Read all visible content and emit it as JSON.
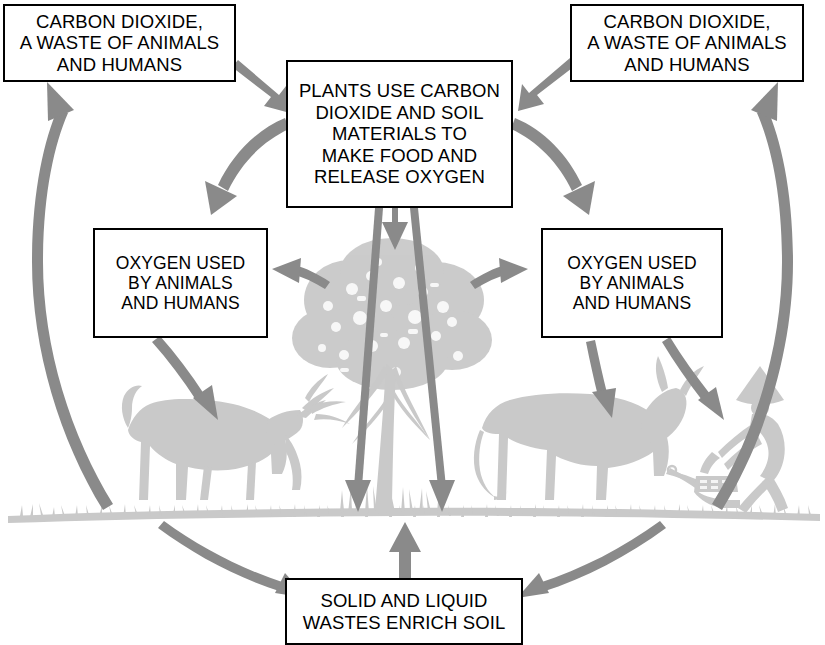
{
  "diagram": {
    "colors": {
      "arrow": "#8a8a8a",
      "silhouette": "#c9c9c9",
      "box_border": "#000000",
      "background": "#ffffff",
      "text": "#000000"
    },
    "boxes": [
      {
        "id": "co2-left",
        "text": "CARBON DIOXIDE,\nA WASTE OF ANIMALS\nAND HUMANS"
      },
      {
        "id": "center",
        "text": "PLANTS USE CARBON\nDIOXIDE AND SOIL\nMATERIALS TO\nMAKE FOOD AND\nRELEASE OXYGEN"
      },
      {
        "id": "co2-right",
        "text": "CARBON DIOXIDE,\nA WASTE OF ANIMALS\nAND HUMANS"
      },
      {
        "id": "oxygen-left",
        "text": "OXYGEN USED\nBY ANIMALS\nAND HUMANS"
      },
      {
        "id": "oxygen-right",
        "text": "OXYGEN USED\nBY ANIMALS\nAND HUMANS"
      },
      {
        "id": "waste",
        "text": "SOLID AND LIQUID\nWASTES ENRICH SOIL"
      }
    ],
    "flows": [
      {
        "from": "co2-left",
        "to": "center",
        "name": "co2-left-to-plants"
      },
      {
        "from": "co2-right",
        "to": "center",
        "name": "co2-right-to-plants"
      },
      {
        "from": "center",
        "to": "oxygen-left",
        "name": "plants-to-oxygen-left"
      },
      {
        "from": "center",
        "to": "oxygen-right",
        "name": "plants-to-oxygen-right"
      },
      {
        "from": "center",
        "to": "soil",
        "name": "plants-roots-to-soil-left"
      },
      {
        "from": "center",
        "to": "soil",
        "name": "plants-roots-to-soil-right"
      },
      {
        "from": "center",
        "to": "tree",
        "name": "plants-to-tree"
      },
      {
        "from": "tree",
        "to": "oxygen-left",
        "name": "tree-oxygen-to-left-box"
      },
      {
        "from": "tree",
        "to": "oxygen-right",
        "name": "tree-oxygen-to-right-box"
      },
      {
        "from": "oxygen-left",
        "to": "grazing-animal",
        "name": "oxygen-left-to-animal"
      },
      {
        "from": "oxygen-right",
        "to": "ox",
        "name": "oxygen-right-to-ox"
      },
      {
        "from": "oxygen-right",
        "to": "farmer",
        "name": "oxygen-right-to-farmer"
      },
      {
        "from": "animals",
        "to": "waste",
        "name": "animals-to-waste"
      },
      {
        "from": "farmer-field",
        "to": "waste",
        "name": "field-to-waste"
      },
      {
        "from": "waste",
        "to": "soil",
        "name": "waste-to-soil"
      },
      {
        "from": "ground-left",
        "to": "co2-left",
        "name": "ground-to-co2-left"
      },
      {
        "from": "ground-right",
        "to": "co2-right",
        "name": "ground-to-co2-right"
      }
    ],
    "silhouettes": [
      {
        "id": "tree",
        "label": "tree"
      },
      {
        "id": "grazing-animal",
        "label": "grazing deer"
      },
      {
        "id": "ox",
        "label": "ox"
      },
      {
        "id": "farmer",
        "label": "farmer with plow"
      },
      {
        "id": "ground",
        "label": "grass and soil line"
      }
    ]
  }
}
